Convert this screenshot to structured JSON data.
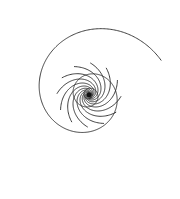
{
  "diagram": {
    "center": [
      89,
      95
    ],
    "stroke_color": "#2a2a2a",
    "background": "#ffffff",
    "arms": {
      "count": 12,
      "growth": 0.55,
      "r_min": 1.5,
      "r_max_angle_span": 5.6,
      "rotation_offset": 0.15
    },
    "rings": {
      "count": 1,
      "growth": -1.8181,
      "start_radius": 80,
      "turns": 4.2
    }
  }
}
